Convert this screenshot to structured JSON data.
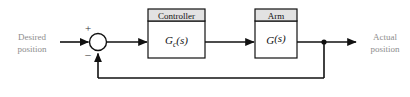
{
  "diagram": {
    "type": "control-system-block-diagram",
    "input": {
      "label_line1": "Desired",
      "label_line2": "position"
    },
    "output": {
      "label_line1": "Actual",
      "label_line2": "position"
    },
    "summing_junction": {
      "name": "summing-junction",
      "plus_sign": "+",
      "minus_sign": "–"
    },
    "blocks": [
      {
        "id": "controller",
        "title": "Controller",
        "transfer_main": "G",
        "transfer_sub": "c",
        "transfer_tail": "(s)"
      },
      {
        "id": "arm",
        "title": "Arm",
        "transfer_main": "G",
        "transfer_sub": "",
        "transfer_tail": "(s)"
      }
    ],
    "colors": {
      "line": "#111111",
      "label_text": "#8d8d8d",
      "block_header_fill": "#e2e2e2",
      "block_body_fill": "#ffffff",
      "background": "#ffffff"
    }
  }
}
